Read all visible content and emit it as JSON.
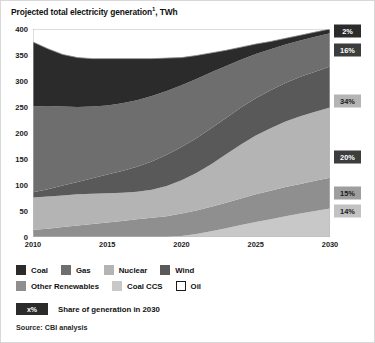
{
  "chart_data": {
    "type": "area",
    "stacked": true,
    "title": "Projected total electricity generation",
    "title_superscript": "1",
    "title_unit": "TWh",
    "xlabel": "",
    "ylabel": "",
    "xlim": [
      2010,
      2030
    ],
    "ylim": [
      0,
      400
    ],
    "yticks": [
      0,
      50,
      100,
      150,
      200,
      250,
      300,
      350,
      400
    ],
    "xticks": [
      2010,
      2015,
      2020,
      2025,
      2030
    ],
    "grid": false,
    "legend_position": "below",
    "x": [
      2010,
      2011,
      2012,
      2013,
      2014,
      2015,
      2016,
      2017,
      2018,
      2019,
      2020,
      2021,
      2022,
      2023,
      2024,
      2025,
      2026,
      2027,
      2028,
      2029,
      2030
    ],
    "stack_order_bottom_to_top": [
      "Coal CCS",
      "Other Renewables",
      "Nuclear",
      "Wind",
      "Gas",
      "Coal"
    ],
    "series": [
      {
        "name": "Coal CCS",
        "color": "#c8c8c8",
        "share_2030": "14%",
        "values": [
          0,
          0,
          0,
          0,
          0,
          0,
          0,
          0,
          0,
          0,
          2,
          6,
          11,
          17,
          23,
          29,
          34,
          40,
          45,
          50,
          55
        ]
      },
      {
        "name": "Other Renewables",
        "color": "#8f8f8f",
        "share_2030": "15%",
        "values": [
          14,
          16,
          19,
          22,
          25,
          28,
          31,
          34,
          37,
          40,
          43,
          45,
          47,
          49,
          51,
          53,
          55,
          56,
          57,
          58,
          59
        ]
      },
      {
        "name": "Wind",
        "color": "#595959",
        "share_2030": "20%",
        "values": [
          10,
          14,
          19,
          24,
          30,
          36,
          42,
          48,
          54,
          60,
          64,
          67,
          69,
          70,
          71,
          72,
          73,
          74,
          76,
          77,
          79
        ]
      },
      {
        "name": "Nuclear",
        "color": "#b4b4b4",
        "share_2030": "34%",
        "values": [
          62,
          62,
          61,
          60,
          58,
          56,
          54,
          53,
          54,
          58,
          64,
          72,
          82,
          93,
          104,
          113,
          120,
          126,
          130,
          133,
          135
        ]
      },
      {
        "name": "Gas",
        "color": "#6e6e6e",
        "share_2030": "16%",
        "values": [
          165,
          160,
          152,
          144,
          138,
          133,
          130,
          128,
          126,
          123,
          119,
          114,
          108,
          100,
          92,
          85,
          79,
          74,
          70,
          67,
          64
        ]
      },
      {
        "name": "Coal",
        "color": "#2b2b2b",
        "share_2030": "2%",
        "values": [
          124,
          110,
          100,
          95,
          92,
          90,
          86,
          80,
          72,
          63,
          53,
          45,
          37,
          30,
          24,
          19,
          15,
          12,
          10,
          9,
          8
        ]
      },
      {
        "name": "Oil",
        "color": "#ffffff",
        "share_2030": "",
        "values": [
          0,
          0,
          0,
          0,
          0,
          0,
          0,
          0,
          0,
          0,
          0,
          0,
          0,
          0,
          0,
          0,
          0,
          0,
          0,
          0,
          0
        ]
      }
    ],
    "totals": [
      375,
      362,
      351,
      345,
      343,
      343,
      343,
      343,
      343,
      344,
      345,
      349,
      354,
      359,
      365,
      371,
      376,
      382,
      388,
      394,
      400
    ],
    "share_callouts": [
      {
        "label": "2%",
        "series": "Coal",
        "value": 396,
        "bg": "#2b2b2b",
        "fg": "#ffffff"
      },
      {
        "label": "16%",
        "series": "Gas",
        "value": 360,
        "bg": "#3d3d3d",
        "fg": "#ffffff"
      },
      {
        "label": "34%",
        "series": "Nuclear",
        "value": 261,
        "bg": "#b4b4b4",
        "fg": "#1a1a1a"
      },
      {
        "label": "20%",
        "series": "Wind",
        "value": 154,
        "bg": "#3d3d3d",
        "fg": "#ffffff"
      },
      {
        "label": "15%",
        "series": "Other Renewables",
        "value": 84,
        "bg": "#9e9e9e",
        "fg": "#1a1a1a"
      },
      {
        "label": "14%",
        "series": "Coal CCS",
        "value": 50,
        "bg": "#c2c2c2",
        "fg": "#1a1a1a"
      }
    ]
  },
  "legend": {
    "rows": [
      [
        {
          "label": "Coal",
          "color": "#2b2b2b",
          "border": "#2b2b2b"
        },
        {
          "label": "Gas",
          "color": "#6e6e6e",
          "border": "#6e6e6e"
        },
        {
          "label": "Nuclear",
          "color": "#b4b4b4",
          "border": "#b4b4b4"
        },
        {
          "label": "Wind",
          "color": "#595959",
          "border": "#595959"
        }
      ],
      [
        {
          "label": "Other Renewables",
          "color": "#8f8f8f",
          "border": "#8f8f8f"
        },
        {
          "label": "Coal CCS",
          "color": "#c8c8c8",
          "border": "#c8c8c8"
        },
        {
          "label": "Oil",
          "color": "#ffffff",
          "border": "#1a1a1a"
        }
      ]
    ]
  },
  "note": {
    "badge": "x%",
    "text": "Share of generation in 2030"
  },
  "source": "Source: CBI analysis"
}
